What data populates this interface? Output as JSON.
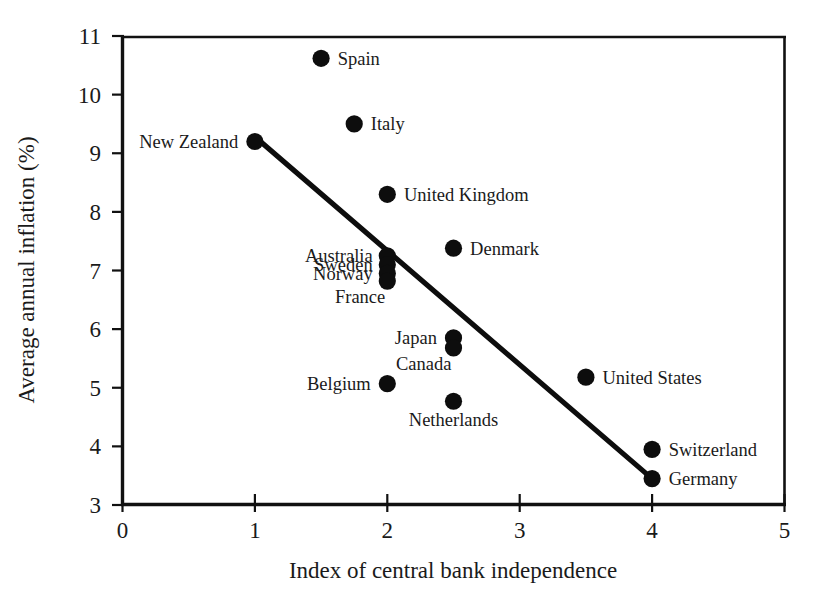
{
  "chart_data": {
    "type": "scatter",
    "title": "",
    "subtitle": "",
    "xlabel": "Index of central bank independence",
    "ylabel": "Average annual inflation (%)",
    "xlim": [
      0,
      5
    ],
    "ylim": [
      3,
      11
    ],
    "xticks": [
      "0",
      "1",
      "2",
      "3",
      "4",
      "5"
    ],
    "yticks": [
      "3",
      "4",
      "5",
      "6",
      "7",
      "8",
      "9",
      "10",
      "11"
    ],
    "grid": false,
    "legend": "none",
    "point_color": "#0d0d0d",
    "line_color": "#0d0d0d",
    "points": [
      {
        "label": "Spain",
        "x": 1.5,
        "y": 10.62,
        "label_side": "right"
      },
      {
        "label": "Italy",
        "x": 1.75,
        "y": 9.5,
        "label_side": "right"
      },
      {
        "label": "New Zealand",
        "x": 1.0,
        "y": 9.2,
        "label_side": "left"
      },
      {
        "label": "United Kingdom",
        "x": 2.0,
        "y": 8.3,
        "label_side": "right"
      },
      {
        "label": "Denmark",
        "x": 2.5,
        "y": 7.38,
        "label_side": "right"
      },
      {
        "label": "Australia",
        "x": 2.0,
        "y": 7.25,
        "label_side": "stack-left"
      },
      {
        "label": "Sweden",
        "x": 2.0,
        "y": 7.1,
        "label_side": "stack-left"
      },
      {
        "label": "Norway",
        "x": 2.0,
        "y": 6.95,
        "label_side": "stack-left"
      },
      {
        "label": "France",
        "x": 2.0,
        "y": 6.82,
        "label_side": "below-left"
      },
      {
        "label": "Japan",
        "x": 2.5,
        "y": 5.85,
        "label_side": "left"
      },
      {
        "label": "Canada",
        "x": 2.5,
        "y": 5.68,
        "label_side": "below-left"
      },
      {
        "label": "Belgium",
        "x": 2.0,
        "y": 5.07,
        "label_side": "left"
      },
      {
        "label": "United States",
        "x": 3.5,
        "y": 5.18,
        "label_side": "right"
      },
      {
        "label": "Netherlands",
        "x": 2.5,
        "y": 4.77,
        "label_side": "below"
      },
      {
        "label": "Switzerland",
        "x": 4.0,
        "y": 3.95,
        "label_side": "right"
      },
      {
        "label": "Germany",
        "x": 4.0,
        "y": 3.45,
        "label_side": "right"
      }
    ],
    "trend_line": {
      "x1": 1.0,
      "y1": 9.28,
      "x2": 4.0,
      "y2": 3.45
    },
    "annotations": []
  }
}
